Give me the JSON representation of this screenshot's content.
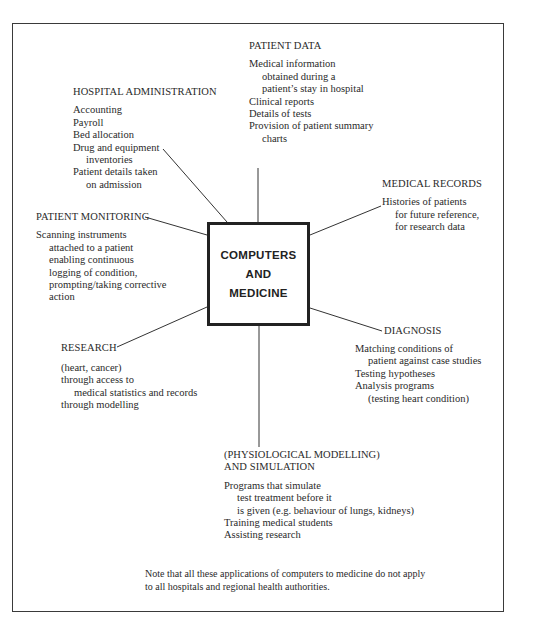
{
  "diagram": {
    "center": {
      "lines": [
        "COMPUTERS",
        "AND",
        "MEDICINE"
      ]
    },
    "nodes": {
      "patient_data": {
        "title": "PATIENT DATA",
        "items": [
          "Medical information",
          "obtained during a",
          "patient’s stay in hospital",
          "Clinical reports",
          "Details of tests",
          "Provision of patient summary",
          "charts"
        ]
      },
      "hospital_administration": {
        "title": "HOSPITAL ADMINISTRATION",
        "items": [
          "Accounting",
          "Payroll",
          "Bed allocation",
          "Drug and equipment",
          "inventories",
          "Patient details taken",
          "on admission"
        ]
      },
      "medical_records": {
        "title": "MEDICAL RECORDS",
        "items": [
          "Histories of patients",
          "for future reference,",
          "for research data"
        ]
      },
      "patient_monitoring": {
        "title": "PATIENT MONITORING",
        "items": [
          "Scanning instruments",
          "attached to a patient",
          "enabling continuous",
          "logging of condition,",
          "prompting/taking corrective",
          "action"
        ]
      },
      "diagnosis": {
        "title": "DIAGNOSIS",
        "items": [
          "Matching conditions of",
          "patient against case studies",
          "Testing hypotheses",
          "Analysis programs",
          "(testing heart condition)"
        ]
      },
      "research": {
        "title": "RESEARCH",
        "items": [
          "(heart, cancer)",
          "through access to",
          "medical statistics and records",
          "through modelling"
        ]
      },
      "simulation": {
        "title_line1": "(PHYSIOLOGICAL MODELLING)",
        "title_line2": "AND SIMULATION",
        "items": [
          "Programs that simulate",
          "test treatment before it",
          "is given (e.g. behaviour of lungs, kidneys)",
          "Training medical students",
          "Assisting research"
        ]
      }
    },
    "note": {
      "line1": "Note that all these applications of computers to medicine do not apply",
      "line2": "to all hospitals and regional health authorities."
    },
    "colors": {
      "ink": "#2a2a2a",
      "frame": "#3a3a3a",
      "background": "#ffffff"
    }
  }
}
